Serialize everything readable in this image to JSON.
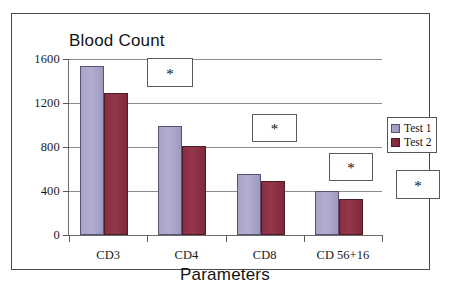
{
  "figure": {
    "title": "Blood Count",
    "x_axis_title": "Parameters"
  },
  "legend": {
    "items": [
      {
        "label": "Test 1",
        "color": "#a9a4c8"
      },
      {
        "label": "Test 2",
        "color": "#8a2f42"
      }
    ]
  },
  "annotations": [
    {
      "name": "significance-marker-cd3",
      "symbol": "*"
    },
    {
      "name": "significance-marker-cd4",
      "symbol": "*"
    },
    {
      "name": "significance-marker-cd8",
      "symbol": "*"
    },
    {
      "name": "significance-marker-cd56-16",
      "symbol": "*"
    }
  ],
  "chart_data": {
    "type": "bar",
    "title": "Blood Count",
    "xlabel": "Parameters",
    "ylabel": "",
    "categories": [
      "CD3",
      "CD4",
      "CD8",
      "CD 56+16"
    ],
    "series": [
      {
        "name": "Test 1",
        "color": "#a9a4c8",
        "values": [
          1540,
          990,
          555,
          400
        ]
      },
      {
        "name": "Test 2",
        "color": "#8a2f42",
        "values": [
          1290,
          810,
          490,
          330
        ]
      }
    ],
    "ylim": [
      0,
      1600
    ],
    "yticks": [
      0,
      400,
      800,
      1200,
      1600
    ],
    "ytick_labels": [
      "0",
      "400",
      "800",
      "1200",
      "1600"
    ],
    "grid": true,
    "legend_position": "right",
    "annotations": [
      "*",
      "*",
      "*",
      "*"
    ]
  }
}
